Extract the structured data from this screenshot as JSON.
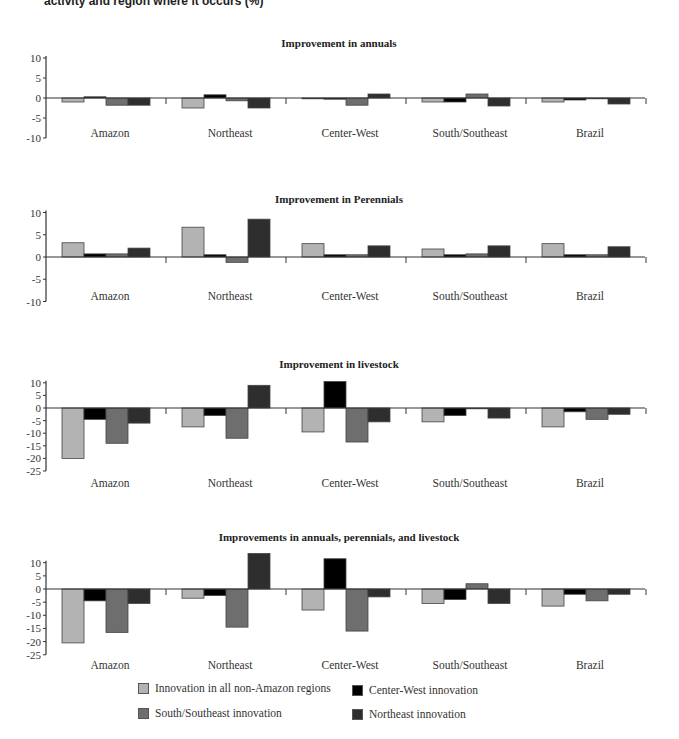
{
  "header": {
    "text": "activity and region where it occurs (%)"
  },
  "colors": {
    "non_amazon": "#b3b3b3",
    "center_west": "#000000",
    "south_southeast": "#6e6e6e",
    "northeast": "#2e2e2e",
    "axis": "#333333"
  },
  "legend": {
    "items": [
      {
        "label": "Innovation in all non-Amazon regions",
        "color": "#b3b3b3"
      },
      {
        "label": "Center-West innovation",
        "color": "#000000"
      },
      {
        "label": "South/Southeast innovation",
        "color": "#6e6e6e"
      },
      {
        "label": "Northeast innovation",
        "color": "#2e2e2e"
      }
    ]
  },
  "chart_data": [
    {
      "type": "bar",
      "title": "Improvement in annuals",
      "categories": [
        "Amazon",
        "Northeast",
        "Center-West",
        "South/Southeast",
        "Brazil"
      ],
      "yticks": [
        10,
        5,
        0,
        -5,
        -10
      ],
      "ylim": [
        -10,
        10
      ],
      "series": [
        {
          "name": "Innovation in all non-Amazon regions",
          "values": [
            -1.0,
            -2.5,
            -0.2,
            -1.0,
            -1.0
          ]
        },
        {
          "name": "Center-West innovation",
          "values": [
            0.3,
            0.8,
            -0.3,
            -1.0,
            -0.5
          ]
        },
        {
          "name": "South/Southeast innovation",
          "values": [
            -1.8,
            -0.7,
            -1.8,
            1.0,
            -0.2
          ]
        },
        {
          "name": "Northeast innovation",
          "values": [
            -1.8,
            -2.5,
            1.0,
            -2.0,
            -1.5
          ]
        }
      ]
    },
    {
      "type": "bar",
      "title": "Improvement in Perennials",
      "categories": [
        "Amazon",
        "Northeast",
        "Center-West",
        "South/Southeast",
        "Brazil"
      ],
      "yticks": [
        10,
        5,
        0,
        -5,
        -10
      ],
      "ylim": [
        -10,
        10
      ],
      "series": [
        {
          "name": "Innovation in all non-Amazon regions",
          "values": [
            3.2,
            6.7,
            3.0,
            1.8,
            3.0
          ]
        },
        {
          "name": "Center-West innovation",
          "values": [
            0.7,
            0.5,
            0.5,
            0.5,
            0.5
          ]
        },
        {
          "name": "South/Southeast innovation",
          "values": [
            0.7,
            -1.2,
            0.5,
            0.7,
            0.5
          ]
        },
        {
          "name": "Northeast innovation",
          "values": [
            2.0,
            8.5,
            2.5,
            2.5,
            2.3
          ]
        }
      ]
    },
    {
      "type": "bar",
      "title": "Improvement in livestock",
      "categories": [
        "Amazon",
        "Northeast",
        "Center-West",
        "South/Southeast",
        "Brazil"
      ],
      "yticks": [
        10,
        5,
        0,
        -5,
        -10,
        -15,
        -20,
        -25
      ],
      "ylim": [
        -25,
        10
      ],
      "series": [
        {
          "name": "Innovation in all non-Amazon regions",
          "values": [
            -20.0,
            -7.5,
            -9.5,
            -5.5,
            -7.5
          ]
        },
        {
          "name": "Center-West innovation",
          "values": [
            -4.5,
            -3.0,
            10.5,
            -3.0,
            -1.5
          ]
        },
        {
          "name": "South/Southeast innovation",
          "values": [
            -14.0,
            -12.0,
            -13.5,
            0,
            -4.5
          ]
        },
        {
          "name": "Northeast innovation",
          "values": [
            -6.0,
            9.0,
            -5.5,
            -4.0,
            -2.5
          ]
        }
      ]
    },
    {
      "type": "bar",
      "title": "Improvements in annuals, perennials, and livestock",
      "categories": [
        "Amazon",
        "Northeast",
        "Center-West",
        "South/Southeast",
        "Brazil"
      ],
      "yticks": [
        10,
        5,
        0,
        -5,
        -10,
        -15,
        -20,
        -25
      ],
      "ylim": [
        -25,
        10
      ],
      "series": [
        {
          "name": "Innovation in all non-Amazon regions",
          "values": [
            -20.5,
            -3.5,
            -8.0,
            -5.5,
            -6.5
          ]
        },
        {
          "name": "Center-West innovation",
          "values": [
            -4.5,
            -2.5,
            11.5,
            -4.0,
            -2.0
          ]
        },
        {
          "name": "South/Southeast innovation",
          "values": [
            -16.5,
            -14.5,
            -16.0,
            2.0,
            -4.5
          ]
        },
        {
          "name": "Northeast innovation",
          "values": [
            -5.5,
            13.5,
            -3.0,
            -5.5,
            -2.0
          ]
        }
      ]
    }
  ]
}
